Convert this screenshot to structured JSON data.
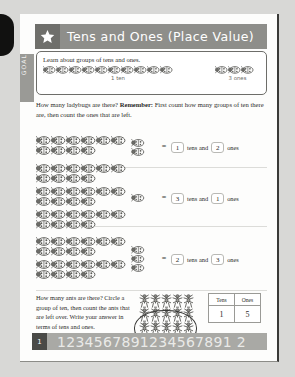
{
  "header": {
    "title": "Tens and Ones (Place Value)",
    "star_icon": "star-icon"
  },
  "goal": {
    "tab_label": "GOAL",
    "heading": "Learn about groups of tens and ones.",
    "tens_group_count": 10,
    "tens_caption": "1 ten",
    "ones_group_count": 3,
    "ones_caption": "3 ones"
  },
  "instruction": {
    "lead": "How many ladybugs are there?",
    "remember_label": "Remember:",
    "body": "First count how many groups of ten there are, then count the ones that are left."
  },
  "exercises": [
    {
      "tens_groups": 1,
      "ones_count": 2,
      "equals": "=",
      "tens_answer": "1",
      "tens_word": "tens and",
      "ones_answer": "2",
      "ones_word": "ones"
    },
    {
      "tens_groups": 3,
      "ones_count": 1,
      "equals": "=",
      "tens_answer": "3",
      "tens_word": "tens and",
      "ones_answer": "1",
      "ones_word": "ones"
    },
    {
      "tens_groups": 2,
      "ones_count": 3,
      "equals": "=",
      "tens_answer": "2",
      "tens_word": "tens and",
      "ones_answer": "3",
      "ones_word": "ones"
    }
  ],
  "bottom_task": {
    "text": "How many ants are there? Circle a group of ten, then count the ants that are left over. Write your answer in terms of tens and ones.",
    "ant_rows": [
      5,
      5,
      5
    ],
    "circled_note": "circle-around-group-of-ten",
    "table": {
      "headers": [
        "Tens",
        "Ones"
      ],
      "values": [
        "1",
        "5"
      ]
    }
  },
  "footer": {
    "page_number": "1",
    "number_strip": "1234567891234567891 2"
  }
}
